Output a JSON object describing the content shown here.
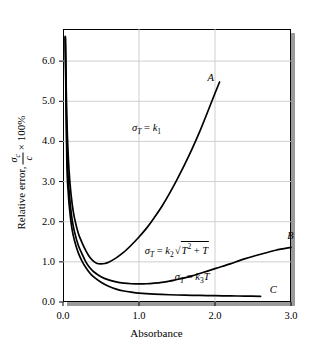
{
  "chart_data": {
    "type": "line",
    "title": "",
    "xlabel": "Absorbance",
    "ylabel_parts": {
      "prefix": "Relative error,",
      "numerator": "σ",
      "numerator_sub": "c",
      "denominator": "c",
      "suffix": "× 100%"
    },
    "xlim": [
      0.0,
      3.0
    ],
    "ylim": [
      0.0,
      6.8
    ],
    "xticks": [
      "0.0",
      "1.0",
      "2.0",
      "3.0"
    ],
    "xtick_values": [
      0.0,
      1.0,
      2.0,
      3.0
    ],
    "yticks": [
      "0.0",
      "1.0",
      "2.0",
      "3.0",
      "4.0",
      "5.0",
      "6.0"
    ],
    "ytick_values": [
      0.0,
      1.0,
      2.0,
      3.0,
      4.0,
      5.0,
      6.0
    ],
    "grid": true,
    "legend": "none",
    "series": [
      {
        "name": "A",
        "label": "A",
        "annotation": "σ_T = k_1",
        "points": [
          [
            0.03,
            6.62
          ],
          [
            0.05,
            4.6
          ],
          [
            0.07,
            3.6
          ],
          [
            0.09,
            3.0
          ],
          [
            0.12,
            2.45
          ],
          [
            0.15,
            2.1
          ],
          [
            0.2,
            1.72
          ],
          [
            0.25,
            1.48
          ],
          [
            0.3,
            1.28
          ],
          [
            0.35,
            1.12
          ],
          [
            0.4,
            1.02
          ],
          [
            0.45,
            0.96
          ],
          [
            0.5,
            0.95
          ],
          [
            0.55,
            0.96
          ],
          [
            0.6,
            0.99
          ],
          [
            0.7,
            1.1
          ],
          [
            0.8,
            1.24
          ],
          [
            0.9,
            1.42
          ],
          [
            1.0,
            1.62
          ],
          [
            1.1,
            1.84
          ],
          [
            1.2,
            2.1
          ],
          [
            1.3,
            2.38
          ],
          [
            1.4,
            2.7
          ],
          [
            1.5,
            3.05
          ],
          [
            1.6,
            3.42
          ],
          [
            1.7,
            3.82
          ],
          [
            1.8,
            4.25
          ],
          [
            1.9,
            4.72
          ],
          [
            2.0,
            5.2
          ],
          [
            2.06,
            5.48
          ]
        ]
      },
      {
        "name": "B",
        "label": "B",
        "annotation": "σ_T = k_2 sqrt(T^2 + T)",
        "points": [
          [
            0.03,
            6.6
          ],
          [
            0.05,
            3.95
          ],
          [
            0.07,
            3.05
          ],
          [
            0.09,
            2.55
          ],
          [
            0.12,
            2.05
          ],
          [
            0.15,
            1.76
          ],
          [
            0.2,
            1.42
          ],
          [
            0.25,
            1.2
          ],
          [
            0.3,
            1.0
          ],
          [
            0.35,
            0.86
          ],
          [
            0.4,
            0.76
          ],
          [
            0.5,
            0.63
          ],
          [
            0.6,
            0.55
          ],
          [
            0.7,
            0.5
          ],
          [
            0.8,
            0.47
          ],
          [
            0.9,
            0.455
          ],
          [
            1.0,
            0.45
          ],
          [
            1.1,
            0.455
          ],
          [
            1.2,
            0.47
          ],
          [
            1.3,
            0.49
          ],
          [
            1.4,
            0.52
          ],
          [
            1.5,
            0.56
          ],
          [
            1.6,
            0.6
          ],
          [
            1.7,
            0.65
          ],
          [
            1.8,
            0.71
          ],
          [
            1.9,
            0.77
          ],
          [
            2.0,
            0.83
          ],
          [
            2.1,
            0.89
          ],
          [
            2.2,
            0.95
          ],
          [
            2.4,
            1.08
          ],
          [
            2.6,
            1.19
          ],
          [
            2.8,
            1.29
          ],
          [
            3.0,
            1.36
          ]
        ]
      },
      {
        "name": "C",
        "label": "C",
        "annotation": "σ_T = k_3 T",
        "points": [
          [
            0.03,
            6.58
          ],
          [
            0.05,
            3.55
          ],
          [
            0.07,
            2.7
          ],
          [
            0.09,
            2.25
          ],
          [
            0.12,
            1.8
          ],
          [
            0.15,
            1.54
          ],
          [
            0.2,
            1.23
          ],
          [
            0.25,
            1.02
          ],
          [
            0.3,
            0.86
          ],
          [
            0.35,
            0.73
          ],
          [
            0.4,
            0.63
          ],
          [
            0.5,
            0.49
          ],
          [
            0.6,
            0.39
          ],
          [
            0.7,
            0.32
          ],
          [
            0.8,
            0.275
          ],
          [
            0.9,
            0.245
          ],
          [
            1.0,
            0.222
          ],
          [
            1.2,
            0.196
          ],
          [
            1.4,
            0.18
          ],
          [
            1.6,
            0.17
          ],
          [
            1.8,
            0.163
          ],
          [
            2.0,
            0.157
          ],
          [
            2.2,
            0.152
          ],
          [
            2.4,
            0.147
          ],
          [
            2.6,
            0.142
          ]
        ]
      }
    ],
    "annotations": [
      {
        "id": "annot-a",
        "text": "σ_T = k_1",
        "x": 1.1,
        "y": 4.3
      },
      {
        "id": "annot-b",
        "text": "σ_T = k_2√(T² + T)",
        "x": 1.5,
        "y": 1.35
      },
      {
        "id": "annot-c",
        "text": "σ_T = k_3T",
        "x": 1.7,
        "y": 0.6
      }
    ],
    "curve_end_labels": [
      {
        "id": "label-a",
        "text": "A",
        "x": 1.9,
        "y": 5.55
      },
      {
        "id": "label-b",
        "text": "B",
        "x": 2.95,
        "y": 1.62
      },
      {
        "id": "label-c",
        "text": "C",
        "x": 2.72,
        "y": 0.28
      }
    ],
    "colors": {
      "curve": "#000000",
      "grid": "#c9c9c9",
      "frame": "#000000",
      "shadow": "#9a9a9a",
      "background": "#ffffff"
    }
  },
  "symbols": {
    "sigma": "σ",
    "times": "×",
    "radical": "√",
    "equals": "=",
    "plus": "+",
    "percent": "100%",
    "T": "T",
    "k": "k",
    "c": "c"
  },
  "axis": {
    "x_title": "Absorbance",
    "y_title_prefix": "Relative error,",
    "y_title_suffix": "× 100%"
  }
}
